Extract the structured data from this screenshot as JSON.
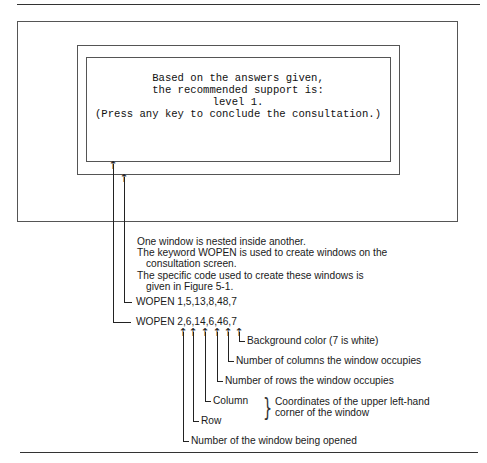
{
  "figure_label_partial": "",
  "screen": {
    "lines": [
      "Based on the answers given,",
      "the recommended support is:",
      "level 1.",
      "(Press any key to conclude the consultation.)"
    ]
  },
  "notes": {
    "line1": "One window is nested inside another.",
    "line2": "The keyword WOPEN is used to create windows on the",
    "line3": "consultation screen.",
    "line4": "The specific code used to create these windows is",
    "line5": "given in Figure 5-1."
  },
  "code": {
    "wopen1": "WOPEN 1,5,13,8,48,7",
    "wopen2": "WOPEN 2,6,14,6,46,7"
  },
  "annotations": {
    "background": "Background color (7 is white)",
    "columns": "Number of columns the window occupies",
    "rows": "Number of rows the window occupies",
    "column": "Column",
    "row": "Row",
    "coords_line1": "Coordinates of the upper left-hand",
    "coords_line2": "corner of the window",
    "window_number": "Number of the window being opened"
  },
  "icons": {
    "arrow_up": "↑",
    "brace": "}"
  }
}
